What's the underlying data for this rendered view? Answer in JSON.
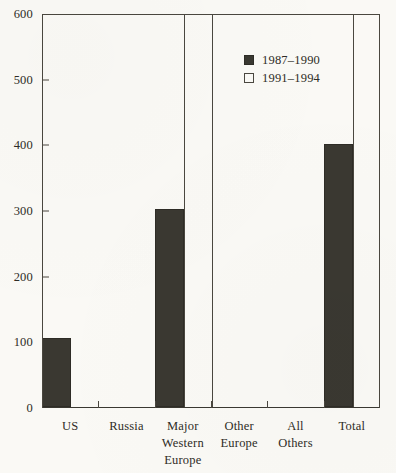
{
  "chart_data": {
    "type": "bar",
    "title": "",
    "xlabel": "",
    "ylabel": "",
    "ylim": [
      0,
      600
    ],
    "yticks": [
      0,
      100,
      200,
      300,
      400,
      500,
      600
    ],
    "ytick_labels": [
      "0",
      "100",
      "200",
      "300",
      "400",
      "500",
      "600"
    ],
    "grid": false,
    "legend_position": "upper center-right",
    "categories": [
      "US",
      "Russia",
      "Major Western Europe",
      "Other Europe",
      "All Others",
      "Total"
    ],
    "category_label_lines": [
      [
        "US"
      ],
      [
        "Russia"
      ],
      [
        "Major",
        "Western",
        "Europe"
      ],
      [
        "Other",
        "Europe"
      ],
      [
        "All",
        "Others"
      ],
      [
        "Total"
      ]
    ],
    "series": [
      {
        "name": "1987–1990",
        "color": "#3a3831",
        "style": "filled",
        "values": [
          105,
          0,
          302,
          0,
          0,
          400
        ]
      },
      {
        "name": "1991–1994",
        "color": "#faf9f5",
        "style": "hollow",
        "values": [
          0,
          0,
          600,
          0,
          0,
          600
        ],
        "value_notes": [
          "",
          "",
          "clipped at axis maximum",
          "",
          "",
          "clipped at axis maximum"
        ]
      }
    ]
  },
  "legend": {
    "entries": [
      {
        "label": "1987–1990",
        "swatch": "filled-dark-square"
      },
      {
        "label": "1991–1994",
        "swatch": "hollow-square"
      }
    ]
  },
  "axes": {
    "y": {
      "ticks": [
        {
          "value": 0,
          "label": "0"
        },
        {
          "value": 100,
          "label": "100"
        },
        {
          "value": 200,
          "label": "200"
        },
        {
          "value": 300,
          "label": "300"
        },
        {
          "value": 400,
          "label": "400"
        },
        {
          "value": 500,
          "label": "500"
        },
        {
          "value": 600,
          "label": "600"
        }
      ]
    },
    "x": {
      "categories": [
        {
          "id": "us",
          "lines": [
            "US"
          ]
        },
        {
          "id": "russia",
          "lines": [
            "Russia"
          ]
        },
        {
          "id": "major-western-europe",
          "lines": [
            "Major",
            "Western",
            "Europe"
          ]
        },
        {
          "id": "other-europe",
          "lines": [
            "Other",
            "Europe"
          ]
        },
        {
          "id": "all-others",
          "lines": [
            "All",
            "Others"
          ]
        },
        {
          "id": "total",
          "lines": [
            "Total"
          ]
        }
      ]
    }
  },
  "colors": {
    "background": "#faf9f5",
    "axis": "#4a473f",
    "series_1987_1990": "#3a3831",
    "series_1991_1994": "#faf9f5",
    "text": "#2e2c26"
  }
}
